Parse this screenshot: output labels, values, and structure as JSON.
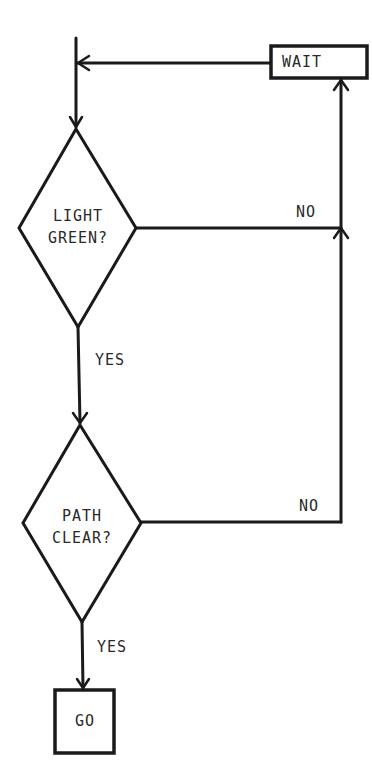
{
  "diagram": {
    "type": "flowchart",
    "nodes": {
      "wait": {
        "shape": "process",
        "label": "WAIT"
      },
      "light_green": {
        "shape": "decision",
        "label_line1": "LIGHT",
        "label_line2": "GREEN?"
      },
      "path_clear": {
        "shape": "decision",
        "label_line1": "PATH",
        "label_line2": "CLEAR?"
      },
      "go": {
        "shape": "process",
        "label": "GO"
      }
    },
    "edges": {
      "light_yes": "YES",
      "light_no": "NO",
      "path_yes": "YES",
      "path_no": "NO"
    },
    "connections": [
      {
        "from": "entry",
        "to": "light_green",
        "label": ""
      },
      {
        "from": "light_green",
        "to": "path_clear",
        "label": "YES"
      },
      {
        "from": "light_green",
        "to": "wait",
        "label": "NO"
      },
      {
        "from": "path_clear",
        "to": "go",
        "label": "YES"
      },
      {
        "from": "path_clear",
        "to": "wait",
        "label": "NO"
      },
      {
        "from": "wait",
        "to": "light_green",
        "label": ""
      }
    ],
    "colors": {
      "ink": "#1a1a1a",
      "background": "#ffffff"
    }
  }
}
